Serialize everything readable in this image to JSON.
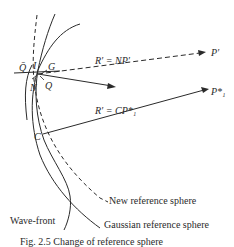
{
  "diagram": {
    "labels": {
      "q_bar": "Q̄",
      "i": "I",
      "g": "G",
      "n": "N",
      "q": "Q",
      "c": "C",
      "r_np": "R′ = NP′",
      "r_cp": "R′ = CP*₁",
      "p_prime": "P′",
      "p1_star": "P*₁",
      "new_reference_sphere": "New reference sphere",
      "gaussian_reference_sphere": "Gaussian reference sphere",
      "wave_front": "Wave-front"
    },
    "caption": "Fig. 2.5 Change of reference sphere",
    "colors": {
      "ink": "#2a2a2a",
      "background": "#ffffff"
    }
  }
}
